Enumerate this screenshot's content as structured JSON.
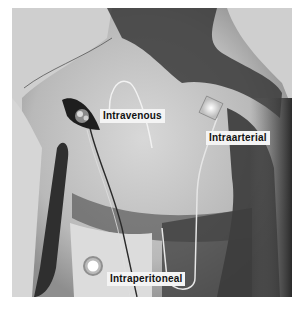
{
  "figure": {
    "labels": {
      "intravenous": "Intravenous",
      "intraarterial": "Intraarterial",
      "intraperitoneal": "Intraperitoneal"
    }
  }
}
